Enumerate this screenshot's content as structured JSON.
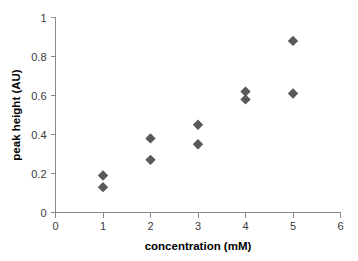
{
  "chart_data": {
    "type": "scatter",
    "title": "",
    "xlabel": "concentration (mM)",
    "ylabel": "peak height (AU)",
    "xlim": [
      0,
      6
    ],
    "ylim": [
      0,
      1
    ],
    "xticks": [
      "0",
      "1",
      "2",
      "3",
      "4",
      "5",
      "6"
    ],
    "yticks": [
      "0",
      "0.2",
      "0.4",
      "0.6",
      "0.8",
      "1"
    ],
    "xtick_values": [
      0,
      1,
      2,
      3,
      4,
      5,
      6
    ],
    "ytick_values": [
      0,
      0.2,
      0.4,
      0.6,
      0.8,
      1
    ],
    "grid": false,
    "legend": false,
    "marker": "diamond",
    "marker_color": "#595959",
    "series": [
      {
        "name": "peak height",
        "points": [
          {
            "x": 1,
            "y": 0.19
          },
          {
            "x": 1,
            "y": 0.13
          },
          {
            "x": 2,
            "y": 0.38
          },
          {
            "x": 2,
            "y": 0.27
          },
          {
            "x": 3,
            "y": 0.45
          },
          {
            "x": 3,
            "y": 0.35
          },
          {
            "x": 4,
            "y": 0.62
          },
          {
            "x": 4,
            "y": 0.58
          },
          {
            "x": 5,
            "y": 0.88
          },
          {
            "x": 5,
            "y": 0.61
          }
        ]
      }
    ]
  },
  "colors": {
    "marker": "#595959",
    "axis": "#8a8a8a",
    "tick_text": "#3a3a3a",
    "axis_title": "#000000",
    "background": "#ffffff"
  }
}
